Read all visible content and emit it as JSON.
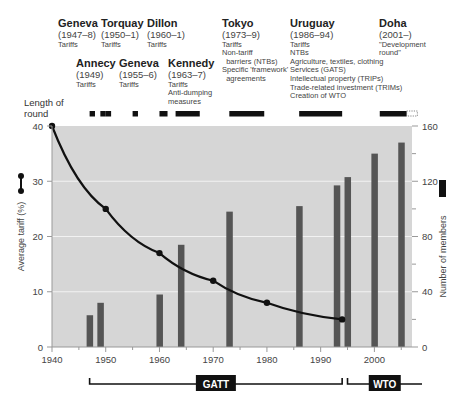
{
  "rounds": [
    {
      "name": "Geneva",
      "years": "(1947–8)",
      "topics": [
        "Tariffs"
      ],
      "x": 58,
      "y": 17
    },
    {
      "name": "Torquay",
      "years": "(1950–1)",
      "topics": [
        "Tariffs"
      ],
      "x": 101,
      "y": 17
    },
    {
      "name": "Dillon",
      "years": "(1960–1)",
      "topics": [
        "Tariffs"
      ],
      "x": 147,
      "y": 17
    },
    {
      "name": "Annecy",
      "years": "(1949)",
      "topics": [
        "Tariffs"
      ],
      "x": 76,
      "y": 57
    },
    {
      "name": "Geneva",
      "years": "(1955–6)",
      "topics": [
        "Tariffs"
      ],
      "x": 119,
      "y": 57
    },
    {
      "name": "Kennedy",
      "years": "(1963–7)",
      "topics": [
        "Tariffs",
        "Anti-dumping",
        "measures"
      ],
      "x": 168,
      "y": 57
    },
    {
      "name": "Tokyo",
      "years": "(1973–9)",
      "topics": [
        "Tariffs",
        "Non-tariff",
        "  barriers (NTBs)",
        "Specific 'framework'",
        "  agreements"
      ],
      "x": 222,
      "y": 17
    },
    {
      "name": "Uruguay",
      "years": "(1986–94)",
      "topics": [
        "Tariffs",
        "NTBs",
        "Agriculture, textiles, clothing",
        "Services (GATS)",
        "Intellectual property (TRIPs)",
        "Trade-related investment (TRIMs)",
        "Creation of WTO"
      ],
      "x": 290,
      "y": 17
    },
    {
      "name": "Doha",
      "years": "(2001–)",
      "topics": [
        "\"Development",
        "round\""
      ],
      "x": 379,
      "y": 17
    }
  ],
  "length_of_round_label": [
    "Length of",
    "round"
  ],
  "round_lengths": [
    {
      "start": 1947,
      "end": 1948
    },
    {
      "start": 1949,
      "end": 1950
    },
    {
      "start": 1950,
      "end": 1951
    },
    {
      "start": 1955,
      "end": 1956
    },
    {
      "start": 1960,
      "end": 1961.5
    },
    {
      "start": 1963,
      "end": 1967.5
    },
    {
      "start": 1973,
      "end": 1979.5
    },
    {
      "start": 1986,
      "end": 1994
    },
    {
      "start": 2001,
      "end": 2006,
      "ongoing_to": 2008
    }
  ],
  "organizations": [
    {
      "label": "GATT",
      "start": 1947,
      "end": 1994
    },
    {
      "label": "WTO",
      "start": 1995,
      "end": 2007
    }
  ],
  "colors": {
    "plot_bg": "#d6d6d6",
    "gridline": "#f2f2f2",
    "bar": "#555555",
    "line": "#111111",
    "round_bar": "#111111"
  },
  "chart_data": {
    "type": "bar+line",
    "title": "",
    "xlabel": "",
    "x_ticks": [
      1940,
      1950,
      1960,
      1970,
      1980,
      1990,
      2000
    ],
    "xlim": [
      1940,
      2007
    ],
    "y_left": {
      "label": "Average tariff (%)",
      "ticks": [
        0,
        10,
        20,
        30,
        40
      ],
      "lim": [
        0,
        40
      ]
    },
    "y_right": {
      "label": "Number of members",
      "ticks": [
        0,
        40,
        80,
        120,
        160
      ],
      "lim": [
        0,
        160
      ]
    },
    "grid": "horizontal",
    "series": [
      {
        "name": "Average tariff (%)",
        "type": "line",
        "axis": "left",
        "x": [
          1940,
          1950,
          1960,
          1970,
          1980,
          1994
        ],
        "values": [
          40,
          25,
          17,
          12,
          8,
          5
        ]
      },
      {
        "name": "Number of members",
        "type": "bar",
        "axis": "right",
        "x": [
          1947,
          1949,
          1960,
          1964,
          1973,
          1986,
          1993,
          1995,
          2000,
          2005
        ],
        "values": [
          23,
          32,
          38,
          74,
          98,
          102,
          117,
          123,
          140,
          148
        ]
      }
    ],
    "legend": [
      {
        "label": "Average tariff (%)",
        "marker": "line-with-dots",
        "position": "left"
      },
      {
        "label": "Number of members",
        "marker": "dark-bar",
        "position": "right"
      }
    ]
  }
}
